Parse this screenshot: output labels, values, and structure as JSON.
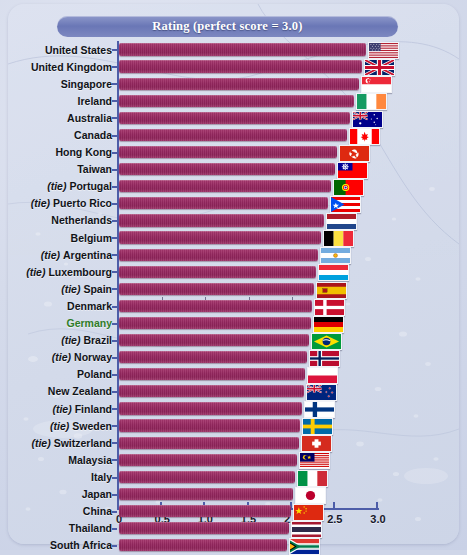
{
  "title": "Rating (perfect score = 3.0)",
  "highlight_color": "#2f7d28",
  "bar_color": "#95275f",
  "axis_color": "#4d5da8",
  "tie_prefix": "(tie)",
  "chart_data": {
    "type": "bar",
    "orientation": "horizontal",
    "title": "Rating (perfect score = 3.0)",
    "xlabel": "",
    "ylabel": "",
    "xlim": [
      0,
      3.0
    ],
    "grid": false,
    "legend": null,
    "ticks": [
      "0",
      "0.5",
      "1.0",
      "1.5",
      "2.0",
      "2.5",
      "3.0"
    ],
    "tick_values": [
      0,
      0.5,
      1.0,
      1.5,
      2.0,
      2.5,
      3.0
    ],
    "categories": [
      "United States",
      "United Kingdom",
      "Singapore",
      "Ireland",
      "Australia",
      "Canada",
      "Hong Kong",
      "Taiwan",
      "Portugal",
      "Puerto Rico",
      "Netherlands",
      "Belgium",
      "Argentina",
      "Luxembourg",
      "Spain",
      "Denmark",
      "Germany",
      "Brazil",
      "Norway",
      "Poland",
      "New Zealand",
      "Finland",
      "Sweden",
      "Switzerland",
      "Malaysia",
      "Italy",
      "Japan",
      "China",
      "Thailand",
      "South Africa"
    ],
    "values": [
      2.86,
      2.82,
      2.78,
      2.72,
      2.68,
      2.64,
      2.52,
      2.5,
      2.46,
      2.42,
      2.38,
      2.34,
      2.3,
      2.28,
      2.26,
      2.24,
      2.22,
      2.2,
      2.18,
      2.16,
      2.14,
      2.12,
      2.1,
      2.08,
      2.06,
      2.04,
      2.01,
      1.99,
      1.97,
      1.95
    ]
  },
  "rows": [
    {
      "label": "United States",
      "tie": false,
      "value": 2.86,
      "flag": "flag-us",
      "highlight": false
    },
    {
      "label": "United Kingdom",
      "tie": false,
      "value": 2.82,
      "flag": "flag-gb",
      "highlight": false
    },
    {
      "label": "Singapore",
      "tie": false,
      "value": 2.78,
      "flag": "flag-sg",
      "highlight": false
    },
    {
      "label": "Ireland",
      "tie": false,
      "value": 2.72,
      "flag": "flag-ie",
      "highlight": false
    },
    {
      "label": "Australia",
      "tie": false,
      "value": 2.68,
      "flag": "flag-au",
      "highlight": false
    },
    {
      "label": "Canada",
      "tie": false,
      "value": 2.64,
      "flag": "flag-ca",
      "highlight": false
    },
    {
      "label": "Hong Kong",
      "tie": false,
      "value": 2.52,
      "flag": "flag-hk",
      "highlight": false
    },
    {
      "label": "Taiwan",
      "tie": false,
      "value": 2.5,
      "flag": "flag-tw",
      "highlight": false
    },
    {
      "label": "Portugal",
      "tie": true,
      "value": 2.46,
      "flag": "flag-pt",
      "highlight": false
    },
    {
      "label": "Puerto Rico",
      "tie": true,
      "value": 2.42,
      "flag": "flag-pr",
      "highlight": false
    },
    {
      "label": "Netherlands",
      "tie": false,
      "value": 2.38,
      "flag": "flag-nl",
      "highlight": false
    },
    {
      "label": "Belgium",
      "tie": false,
      "value": 2.34,
      "flag": "flag-be",
      "highlight": false
    },
    {
      "label": "Argentina",
      "tie": true,
      "value": 2.3,
      "flag": "flag-ar",
      "highlight": false
    },
    {
      "label": "Luxembourg",
      "tie": true,
      "value": 2.28,
      "flag": "flag-lu",
      "highlight": false
    },
    {
      "label": "Spain",
      "tie": true,
      "value": 2.26,
      "flag": "flag-es",
      "highlight": false
    },
    {
      "label": "Denmark",
      "tie": false,
      "value": 2.24,
      "flag": "flag-dk",
      "highlight": false
    },
    {
      "label": "Germany",
      "tie": false,
      "value": 2.22,
      "flag": "flag-de",
      "highlight": true
    },
    {
      "label": "Brazil",
      "tie": true,
      "value": 2.2,
      "flag": "flag-br",
      "highlight": false
    },
    {
      "label": "Norway",
      "tie": true,
      "value": 2.18,
      "flag": "flag-no",
      "highlight": false
    },
    {
      "label": "Poland",
      "tie": false,
      "value": 2.16,
      "flag": "flag-pl",
      "highlight": false
    },
    {
      "label": "New Zealand",
      "tie": false,
      "value": 2.14,
      "flag": "flag-nz",
      "highlight": false
    },
    {
      "label": "Finland",
      "tie": true,
      "value": 2.12,
      "flag": "flag-fi",
      "highlight": false
    },
    {
      "label": "Sweden",
      "tie": true,
      "value": 2.1,
      "flag": "flag-se",
      "highlight": false
    },
    {
      "label": "Switzerland",
      "tie": true,
      "value": 2.08,
      "flag": "flag-ch",
      "highlight": false
    },
    {
      "label": "Malaysia",
      "tie": false,
      "value": 2.06,
      "flag": "flag-my",
      "highlight": false
    },
    {
      "label": "Italy",
      "tie": false,
      "value": 2.04,
      "flag": "flag-it",
      "highlight": false
    },
    {
      "label": "Japan",
      "tie": false,
      "value": 2.01,
      "flag": "flag-jp",
      "highlight": false
    },
    {
      "label": "China",
      "tie": false,
      "value": 1.99,
      "flag": "flag-cn",
      "highlight": false
    },
    {
      "label": "Thailand",
      "tie": false,
      "value": 1.97,
      "flag": "flag-th",
      "highlight": false
    },
    {
      "label": "South Africa",
      "tie": false,
      "value": 1.95,
      "flag": "flag-za",
      "highlight": false
    }
  ]
}
